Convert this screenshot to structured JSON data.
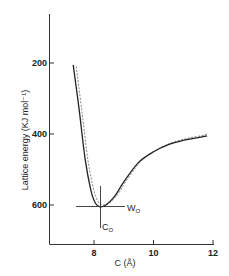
{
  "chart_data": {
    "type": "line",
    "title": "",
    "xlabel": "C (Å)",
    "ylabel": "Lattice energy (KJ mol⁻¹)",
    "xlim": [
      6.5,
      12.3
    ],
    "ylim": [
      700,
      50
    ],
    "y_inverted": true,
    "grid": false,
    "legend": null,
    "x_ticks": [
      8,
      10,
      12
    ],
    "y_ticks": [
      200,
      400,
      600
    ],
    "series": [
      {
        "name": "solid",
        "style": "solid",
        "x": [
          7.3,
          7.5,
          7.7,
          7.9,
          8.05,
          8.2,
          8.4,
          8.7,
          9.0,
          9.5,
          10.0,
          10.5,
          11.0,
          11.5,
          11.8
        ],
        "y": [
          205,
          330,
          470,
          560,
          595,
          605,
          600,
          575,
          535,
          480,
          450,
          430,
          418,
          410,
          405
        ]
      },
      {
        "name": "dashed",
        "style": "dashed",
        "x": [
          7.4,
          7.6,
          7.8,
          8.0,
          8.15,
          8.3,
          8.5,
          8.8,
          9.1,
          9.6,
          10.1,
          10.6,
          11.1,
          11.6,
          11.8
        ],
        "y": [
          210,
          340,
          475,
          560,
          592,
          600,
          595,
          570,
          530,
          475,
          445,
          425,
          413,
          405,
          400
        ]
      }
    ],
    "annotations": [
      {
        "text": "W₀",
        "x": 9.0,
        "y": 608,
        "desc": "horizontal line at minimum energy"
      },
      {
        "text": "C₀",
        "x": 8.25,
        "y": 660,
        "desc": "vertical line at minimum lattice constant"
      }
    ]
  },
  "labels": {
    "xlabel": "C (Å)",
    "ylabel": "Lattice energy (KJ mol⁻¹)",
    "x_ticks": [
      "8",
      "10",
      "12"
    ],
    "y_ticks": [
      "200",
      "400",
      "600"
    ],
    "w0": "W",
    "w0_sub": "O",
    "c0": "C",
    "c0_sub": "O"
  }
}
